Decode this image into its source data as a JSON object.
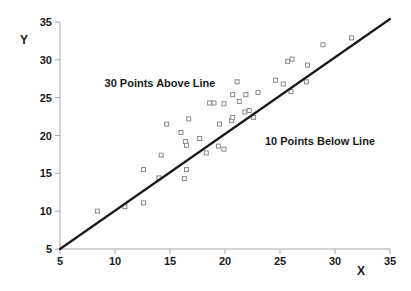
{
  "chart_data": {
    "type": "scatter",
    "title": "",
    "xlabel": "X",
    "ylabel": "Y",
    "xlim": [
      5,
      35
    ],
    "ylim": [
      5,
      35
    ],
    "xticks": [
      5,
      10,
      15,
      20,
      25,
      30,
      35
    ],
    "yticks": [
      5,
      10,
      15,
      20,
      25,
      30,
      35
    ],
    "grid": false,
    "legend": false,
    "line": {
      "description": "reference line y = x",
      "x1": 5,
      "y1": 5,
      "x2": 35,
      "y2": 35.4
    },
    "annotations": [
      {
        "text": "30 Points Above Line",
        "x": 14.1,
        "y": 26.9
      },
      {
        "text": "10 Points Below Line",
        "x": 28.6,
        "y": 19.3
      }
    ],
    "series": [
      {
        "name": "points-above-line",
        "count": 30,
        "points": [
          [
            8.4,
            10.0
          ],
          [
            12.6,
            15.5
          ],
          [
            14.0,
            14.4
          ],
          [
            14.2,
            17.4
          ],
          [
            14.7,
            21.5
          ],
          [
            16.0,
            20.4
          ],
          [
            16.4,
            19.2
          ],
          [
            16.5,
            18.7
          ],
          [
            16.7,
            22.2
          ],
          [
            17.7,
            19.6
          ],
          [
            18.6,
            24.3
          ],
          [
            19.0,
            24.3
          ],
          [
            19.5,
            21.5
          ],
          [
            19.9,
            24.2
          ],
          [
            20.6,
            22.0
          ],
          [
            20.7,
            22.4
          ],
          [
            20.7,
            25.4
          ],
          [
            21.1,
            27.1
          ],
          [
            21.3,
            24.5
          ],
          [
            21.8,
            23.1
          ],
          [
            21.9,
            25.4
          ],
          [
            22.2,
            23.3
          ],
          [
            23.0,
            25.7
          ],
          [
            24.6,
            27.3
          ],
          [
            25.3,
            26.8
          ],
          [
            25.7,
            29.8
          ],
          [
            26.1,
            30.1
          ],
          [
            27.5,
            29.3
          ],
          [
            28.9,
            32.0
          ],
          [
            31.5,
            32.9
          ]
        ]
      },
      {
        "name": "points-below-line",
        "count": 10,
        "points": [
          [
            10.9,
            10.6
          ],
          [
            12.6,
            11.1
          ],
          [
            16.3,
            14.3
          ],
          [
            16.5,
            15.5
          ],
          [
            18.3,
            17.7
          ],
          [
            19.4,
            18.6
          ],
          [
            19.9,
            18.2
          ],
          [
            22.6,
            22.4
          ],
          [
            26.0,
            25.8
          ],
          [
            27.4,
            27.1
          ]
        ]
      }
    ],
    "colors": {
      "background": "#ffffff",
      "axis": "#a8a8a8",
      "tick_label": "#1a1a1a",
      "marker_stroke": "#8a8a8a",
      "marker_fill": "#ffffff",
      "line": "#1a1a1a",
      "text": "#1a1a1a"
    }
  }
}
